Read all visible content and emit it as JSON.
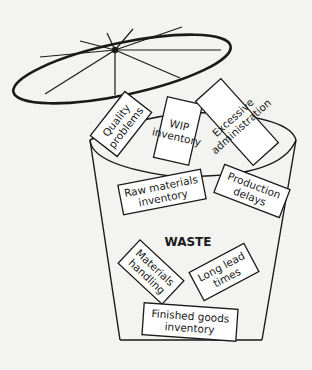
{
  "diagram": {
    "title": "WASTE",
    "colors": {
      "ink": "#1a1a1a",
      "paper": "#f3f3f1",
      "box": "#ffffff"
    },
    "lid": {
      "description": "open bin lid with spokes"
    },
    "labels": [
      {
        "id": "quality-problems",
        "lines": [
          "Quality",
          "problems"
        ]
      },
      {
        "id": "wip-inventory",
        "lines": [
          "WIP",
          "inventory"
        ]
      },
      {
        "id": "excessive-administration",
        "lines": [
          "Excessive",
          "administration"
        ]
      },
      {
        "id": "raw-materials-inventory",
        "lines": [
          "Raw materials",
          "inventory"
        ]
      },
      {
        "id": "production-delays",
        "lines": [
          "Production",
          "delays"
        ]
      },
      {
        "id": "materials-handling",
        "lines": [
          "Materials",
          "handling"
        ]
      },
      {
        "id": "long-lead-times",
        "lines": [
          "Long lead",
          "times"
        ]
      },
      {
        "id": "finished-goods-inventory",
        "lines": [
          "Finished goods",
          "inventory"
        ]
      }
    ]
  }
}
